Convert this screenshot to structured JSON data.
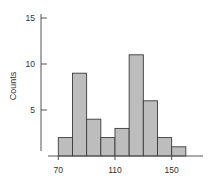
{
  "chart_data": {
    "type": "bar",
    "subtype": "histogram",
    "title": "",
    "xlabel": "",
    "ylabel": "Counts",
    "bin_edges": [
      70,
      80,
      90,
      100,
      110,
      120,
      130,
      140,
      150,
      160
    ],
    "categories": [
      "70-80",
      "80-90",
      "90-100",
      "100-110",
      "110-120",
      "120-130",
      "130-140",
      "140-150",
      "150-160"
    ],
    "values": [
      2,
      9,
      4,
      2,
      3,
      11,
      6,
      2,
      1
    ],
    "xlim": [
      70,
      165
    ],
    "ylim": [
      0,
      15
    ],
    "x_ticks": [
      70,
      110,
      150
    ],
    "y_ticks": [
      5,
      10,
      15
    ],
    "grid": false,
    "legend": null,
    "colors": {
      "bar_fill": "#bdbdbd",
      "bar_edge": "#3a3a3a",
      "axis": "#555555"
    }
  }
}
